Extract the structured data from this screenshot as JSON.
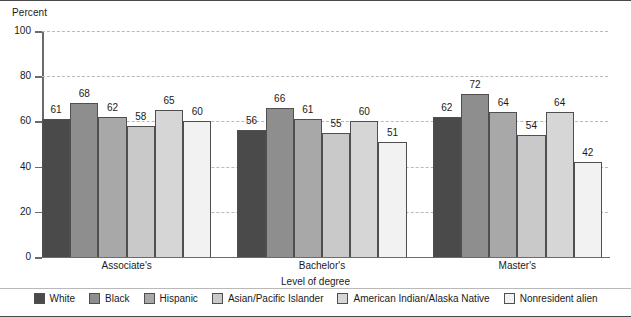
{
  "chart_data": {
    "type": "bar",
    "title": "",
    "ylabel": "Percent",
    "xlabel": "Level of degree",
    "ylim": [
      0,
      100
    ],
    "yticks": [
      0,
      20,
      40,
      60,
      80,
      100
    ],
    "grid": true,
    "legend_position": "bottom",
    "categories": [
      "Associate's",
      "Bachelor's",
      "Master's"
    ],
    "series": [
      {
        "name": "White",
        "color": "#4a4a4a",
        "values": [
          61,
          56,
          62
        ]
      },
      {
        "name": "Black",
        "color": "#8e8e8e",
        "values": [
          68,
          66,
          72
        ]
      },
      {
        "name": "Hispanic",
        "color": "#a8a8a8",
        "values": [
          62,
          61,
          64
        ]
      },
      {
        "name": "Asian/Pacific Islander",
        "color": "#c9c9c9",
        "values": [
          58,
          55,
          54
        ]
      },
      {
        "name": "American Indian/Alaska Native",
        "color": "#d6d6d6",
        "values": [
          65,
          60,
          64
        ]
      },
      {
        "name": "Nonresident alien",
        "color": "#f2f2f2",
        "values": [
          60,
          51,
          42
        ]
      }
    ]
  },
  "axis": {
    "y_title": "Percent",
    "x_title": "Level of degree",
    "tick_labels": [
      "100",
      "80",
      "60",
      "40",
      "20",
      "0"
    ]
  },
  "legend": {
    "items": [
      {
        "label": "White"
      },
      {
        "label": "Black"
      },
      {
        "label": "Hispanic"
      },
      {
        "label": "Asian/Pacific Islander"
      },
      {
        "label": "American Indian/Alaska Native"
      },
      {
        "label": "Nonresident alien"
      }
    ]
  }
}
